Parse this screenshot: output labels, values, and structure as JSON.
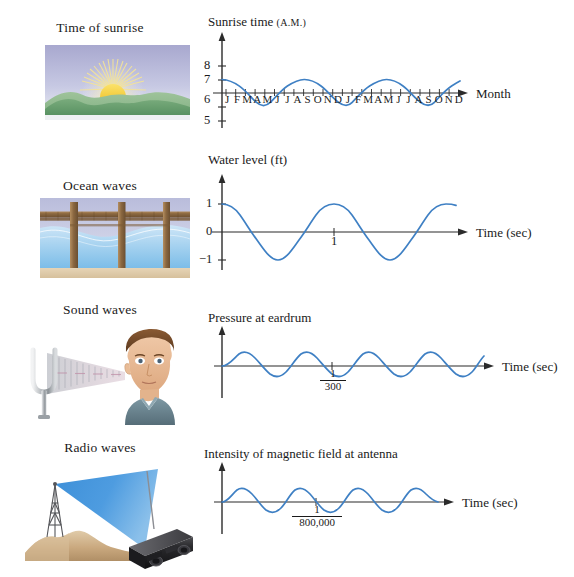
{
  "page": {
    "background": "#ffffff",
    "curve_color": "#3f80c4",
    "axis_color": "#2b2b2b"
  },
  "rows": [
    {
      "id": "sunrise",
      "illustration_caption": "Time of sunrise",
      "illustration_name": "sunrise-over-hills-illustration",
      "chart_title": "Sunrise time",
      "chart_title_suffix": "(A.M.)",
      "x_axis_label": "Month",
      "y_tick_labels": [
        "8",
        "7",
        "6",
        "5"
      ],
      "month_ticks": [
        "J",
        "F",
        "M",
        "A",
        "M",
        "J",
        "J",
        "A",
        "S",
        "O",
        "N",
        "D",
        "J",
        "F",
        "M",
        "A",
        "M",
        "J",
        "J",
        "A",
        "S",
        "O",
        "N",
        "D"
      ],
      "chart_data": {
        "type": "line",
        "title": "Sunrise time (A.M.)",
        "xlabel": "Month",
        "ylabel": "Sunrise time (A.M.)",
        "ylim": [
          4.6,
          8.4
        ],
        "xlim": [
          0,
          24
        ],
        "yticks": [
          8,
          7,
          6,
          5
        ],
        "axis_crossing_y": 6.5,
        "grid": false,
        "legend": false,
        "xtick_labels": [
          "J",
          "F",
          "M",
          "A",
          "M",
          "J",
          "J",
          "A",
          "S",
          "O",
          "N",
          "D",
          "J",
          "F",
          "M",
          "A",
          "M",
          "J",
          "J",
          "A",
          "S",
          "O",
          "N",
          "D"
        ],
        "series": [
          {
            "name": "Sunrise time",
            "form": "y = 6.5 + 1.0*cos(2*pi*x/12)",
            "amplitude": 1.0,
            "midline": 6.5,
            "period_months": 12,
            "x": [
              0,
              1,
              2,
              3,
              4,
              5,
              6,
              7,
              8,
              9,
              10,
              11,
              12,
              13,
              14,
              15,
              16,
              17,
              18,
              19,
              20,
              21,
              22,
              23,
              24
            ],
            "values": [
              7.5,
              7.37,
              7.0,
              6.5,
              6.0,
              5.63,
              5.5,
              5.63,
              6.0,
              6.5,
              7.0,
              7.37,
              7.5,
              7.37,
              7.0,
              6.5,
              6.0,
              5.63,
              5.5,
              5.63,
              6.0,
              6.5,
              7.0,
              7.37,
              7.5
            ]
          }
        ]
      }
    },
    {
      "id": "ocean",
      "illustration_caption": "Ocean waves",
      "illustration_name": "pier-over-ocean-waves-illustration",
      "chart_title": "Water level (ft)",
      "chart_title_suffix": "",
      "x_axis_label": "Time (sec)",
      "y_tick_labels": [
        "1",
        "0",
        "−1"
      ],
      "x_tick_labels": [
        "1"
      ],
      "chart_data": {
        "type": "line",
        "title": "Water level (ft)",
        "xlabel": "Time (sec)",
        "ylabel": "Water level (ft)",
        "ylim": [
          -1.35,
          1.35
        ],
        "xlim": [
          0,
          2.6
        ],
        "yticks": [
          1,
          0,
          -1
        ],
        "xticks": [
          1
        ],
        "axis_crossing_y": 0,
        "grid": false,
        "legend": false,
        "series": [
          {
            "name": "Water level",
            "form": "y = cos(2*pi*x/1.33)",
            "amplitude": 1.0,
            "midline": 0,
            "period_sec": 1.33,
            "x": [
              0,
              0.17,
              0.33,
              0.5,
              0.67,
              0.83,
              1.0,
              1.17,
              1.33,
              1.5,
              1.67,
              1.83,
              2.0,
              2.17,
              2.33,
              2.5
            ],
            "values": [
              1.0,
              0.71,
              0.0,
              -0.71,
              -1.0,
              -0.71,
              0.0,
              0.71,
              1.0,
              0.71,
              0.0,
              -0.71,
              -1.0,
              -0.71,
              0.0,
              0.71
            ]
          }
        ]
      }
    },
    {
      "id": "sound",
      "illustration_caption": "Sound waves",
      "illustration_name": "tuning-fork-and-listener-illustration",
      "chart_title": "Pressure at eardrum",
      "chart_title_suffix": "",
      "x_axis_label": "Time (sec)",
      "x_tick_fraction_numerator": "1",
      "x_tick_fraction_denominator": "300",
      "chart_data": {
        "type": "line",
        "title": "Pressure at eardrum",
        "xlabel": "Time (sec)",
        "ylabel": "Pressure at eardrum",
        "ylim": [
          -1.4,
          1.4
        ],
        "xlim": [
          0,
          2.6
        ],
        "yticks": [],
        "xticks": [
          1
        ],
        "xtick_labels": [
          "1/300"
        ],
        "axis_crossing_y": 0,
        "grid": false,
        "legend": false,
        "series": [
          {
            "name": "Pressure",
            "form": "y = sin(2*pi*x)",
            "amplitude": 1.0,
            "midline": 0,
            "period_sec": 0.003333,
            "x": [
              0,
              0.25,
              0.5,
              0.75,
              1.0,
              1.25,
              1.5,
              1.75,
              2.0,
              2.25,
              2.5
            ],
            "values": [
              0,
              1,
              0,
              -1,
              0,
              1,
              0,
              -1,
              0,
              1,
              0.85
            ]
          }
        ]
      }
    },
    {
      "id": "radio",
      "illustration_caption": "Radio waves",
      "illustration_name": "transmission-tower-and-radio-illustration",
      "chart_title": "Intensity of magnetic field at antenna",
      "chart_title_suffix": "",
      "x_axis_label": "Time (sec)",
      "x_tick_fraction_numerator": "1",
      "x_tick_fraction_denominator": "800,000",
      "chart_data": {
        "type": "line",
        "title": "Intensity of magnetic field at antenna",
        "xlabel": "Time (sec)",
        "ylabel": "Intensity of magnetic field at antenna",
        "ylim": [
          -1.4,
          1.4
        ],
        "xlim": [
          0,
          2.6
        ],
        "yticks": [],
        "xticks": [
          1
        ],
        "xtick_labels": [
          "1/800,000"
        ],
        "axis_crossing_y": 0,
        "grid": false,
        "legend": false,
        "series": [
          {
            "name": "Magnetic field intensity",
            "form": "y = sin(2*pi*x)",
            "amplitude": 1.0,
            "midline": 0,
            "period_sec": 1.25e-06,
            "x": [
              0,
              0.25,
              0.5,
              0.75,
              1.0,
              1.25,
              1.5,
              1.75,
              2.0,
              2.25,
              2.5
            ],
            "values": [
              0,
              1,
              0,
              -1,
              0,
              1,
              0,
              -1,
              0,
              1,
              0
            ]
          }
        ]
      }
    }
  ]
}
